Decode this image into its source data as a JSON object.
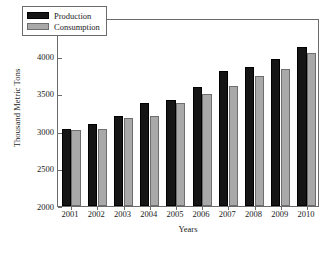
{
  "chart_data": {
    "type": "bar",
    "title": "",
    "xlabel": "Years",
    "ylabel": "Thousand Metric Tons",
    "categories": [
      "2001",
      "2002",
      "2003",
      "2004",
      "2005",
      "2006",
      "2007",
      "2008",
      "2009",
      "2010"
    ],
    "series": [
      {
        "name": "Production",
        "color": "#151515",
        "values": [
          3030,
          3095,
          3195,
          3375,
          3415,
          3585,
          3790,
          3845,
          3960,
          4110
        ]
      },
      {
        "name": "Consumption",
        "color": "#a9a9a9",
        "values": [
          3010,
          3025,
          3170,
          3200,
          3375,
          3495,
          3590,
          3730,
          3825,
          4035
        ]
      }
    ],
    "ylim": [
      2000,
      4500
    ],
    "ytick_values": [
      2000,
      2500,
      3000,
      3500,
      4000,
      4500
    ],
    "ytick_labels": [
      "2000",
      "2500",
      "3000",
      "3500",
      "4000",
      "4500"
    ],
    "grid": false,
    "legend_position": "upper-left-inside"
  },
  "legend": {
    "entries": [
      {
        "label": "Production"
      },
      {
        "label": "Consumption"
      }
    ]
  }
}
